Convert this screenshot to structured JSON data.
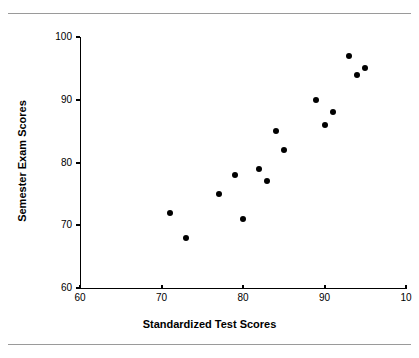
{
  "chart_data": {
    "type": "scatter",
    "title": "",
    "xlabel": "Standardized Test Scores",
    "ylabel": "Semester Exam Scores",
    "xlim": [
      60,
      100
    ],
    "ylim": [
      60,
      100
    ],
    "xticks": [
      60,
      70,
      80,
      90,
      100
    ],
    "yticks": [
      60,
      70,
      80,
      90,
      100
    ],
    "xtick_labels": [
      "60",
      "70",
      "80",
      "90",
      "10"
    ],
    "ytick_labels": [
      "60",
      "70",
      "80",
      "90",
      "100"
    ],
    "grid": false,
    "legend": false,
    "marker_color": "#000000",
    "series": [
      {
        "name": "students",
        "points": [
          {
            "x": 71,
            "y": 72
          },
          {
            "x": 73,
            "y": 68
          },
          {
            "x": 77,
            "y": 75
          },
          {
            "x": 79,
            "y": 78
          },
          {
            "x": 80,
            "y": 71
          },
          {
            "x": 82,
            "y": 79
          },
          {
            "x": 83,
            "y": 77
          },
          {
            "x": 84,
            "y": 85
          },
          {
            "x": 85,
            "y": 82
          },
          {
            "x": 89,
            "y": 90
          },
          {
            "x": 90,
            "y": 86
          },
          {
            "x": 91,
            "y": 88
          },
          {
            "x": 93,
            "y": 97
          },
          {
            "x": 94,
            "y": 94
          },
          {
            "x": 95,
            "y": 95
          }
        ]
      }
    ]
  },
  "figure": {
    "background_color": "#ffffff",
    "rule_color": "#9a9a9a"
  }
}
